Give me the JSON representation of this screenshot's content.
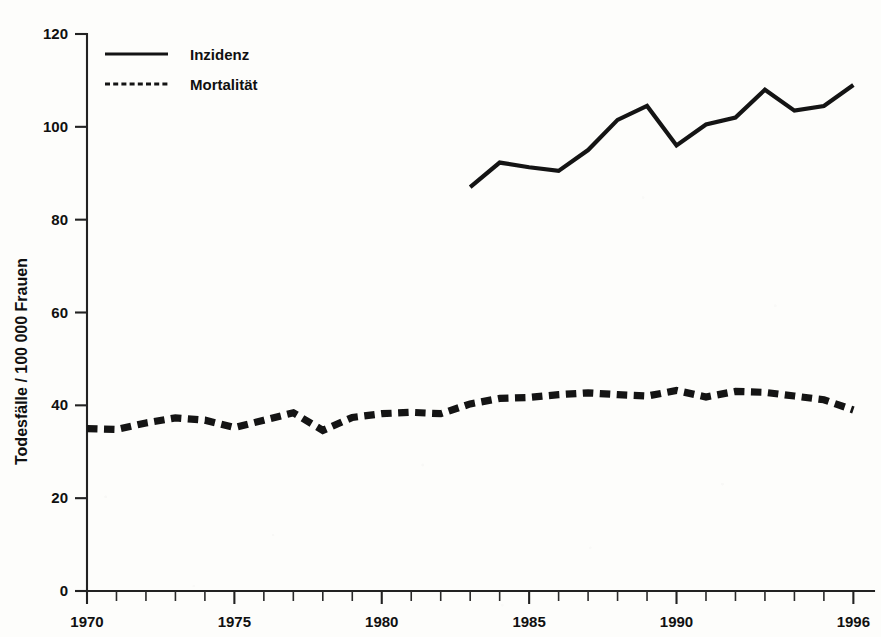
{
  "chart_data": {
    "type": "line",
    "title": "",
    "xlabel": "",
    "ylabel": "Todesfälle / 100 000 Frauen",
    "xlim": [
      1970,
      1996.7
    ],
    "ylim": [
      0,
      120
    ],
    "grid": false,
    "legend_position": "top-left",
    "x_tick_labels": [
      "1970",
      "1975",
      "1980",
      "1985",
      "1990",
      "1996"
    ],
    "x_tick_values": [
      1970,
      1975,
      1980,
      1985,
      1990,
      1996
    ],
    "x_minor_tick_values": [
      1971,
      1972,
      1973,
      1974,
      1976,
      1977,
      1978,
      1979,
      1981,
      1982,
      1983,
      1984,
      1986,
      1987,
      1988,
      1989,
      1991,
      1992,
      1993,
      1994,
      1995
    ],
    "y_tick_labels": [
      "0",
      "20",
      "40",
      "60",
      "80",
      "100",
      "120"
    ],
    "y_tick_values": [
      0,
      20,
      40,
      60,
      80,
      100,
      120
    ],
    "series": [
      {
        "name": "Inzidenz",
        "style": "solid",
        "color": "#141414",
        "x": [
          1983,
          1984,
          1985,
          1986,
          1987,
          1988,
          1989,
          1990,
          1991,
          1992,
          1993,
          1994,
          1995,
          1996
        ],
        "values": [
          87.0,
          92.3,
          91.3,
          90.5,
          95.0,
          101.5,
          104.5,
          96.0,
          100.5,
          102.0,
          108.0,
          103.5,
          104.5,
          109.0
        ]
      },
      {
        "name": "Mortalität",
        "style": "dashed",
        "color": "#141414",
        "x": [
          1970,
          1971,
          1972,
          1973,
          1974,
          1975,
          1976,
          1977,
          1978,
          1979,
          1980,
          1981,
          1982,
          1983,
          1984,
          1985,
          1986,
          1987,
          1988,
          1989,
          1990,
          1991,
          1992,
          1993,
          1994,
          1995,
          1996
        ],
        "values": [
          35.0,
          34.8,
          36.2,
          37.3,
          36.8,
          35.2,
          36.8,
          38.4,
          34.6,
          37.4,
          38.2,
          38.5,
          38.2,
          40.3,
          41.5,
          41.7,
          42.3,
          42.7,
          42.3,
          42.0,
          43.2,
          41.8,
          43.0,
          42.8,
          42.0,
          41.2,
          39.0
        ]
      }
    ]
  },
  "legend": {
    "items": [
      {
        "label": "Inzidenz",
        "style": "solid"
      },
      {
        "label": "Mortalität",
        "style": "dashed"
      }
    ]
  }
}
